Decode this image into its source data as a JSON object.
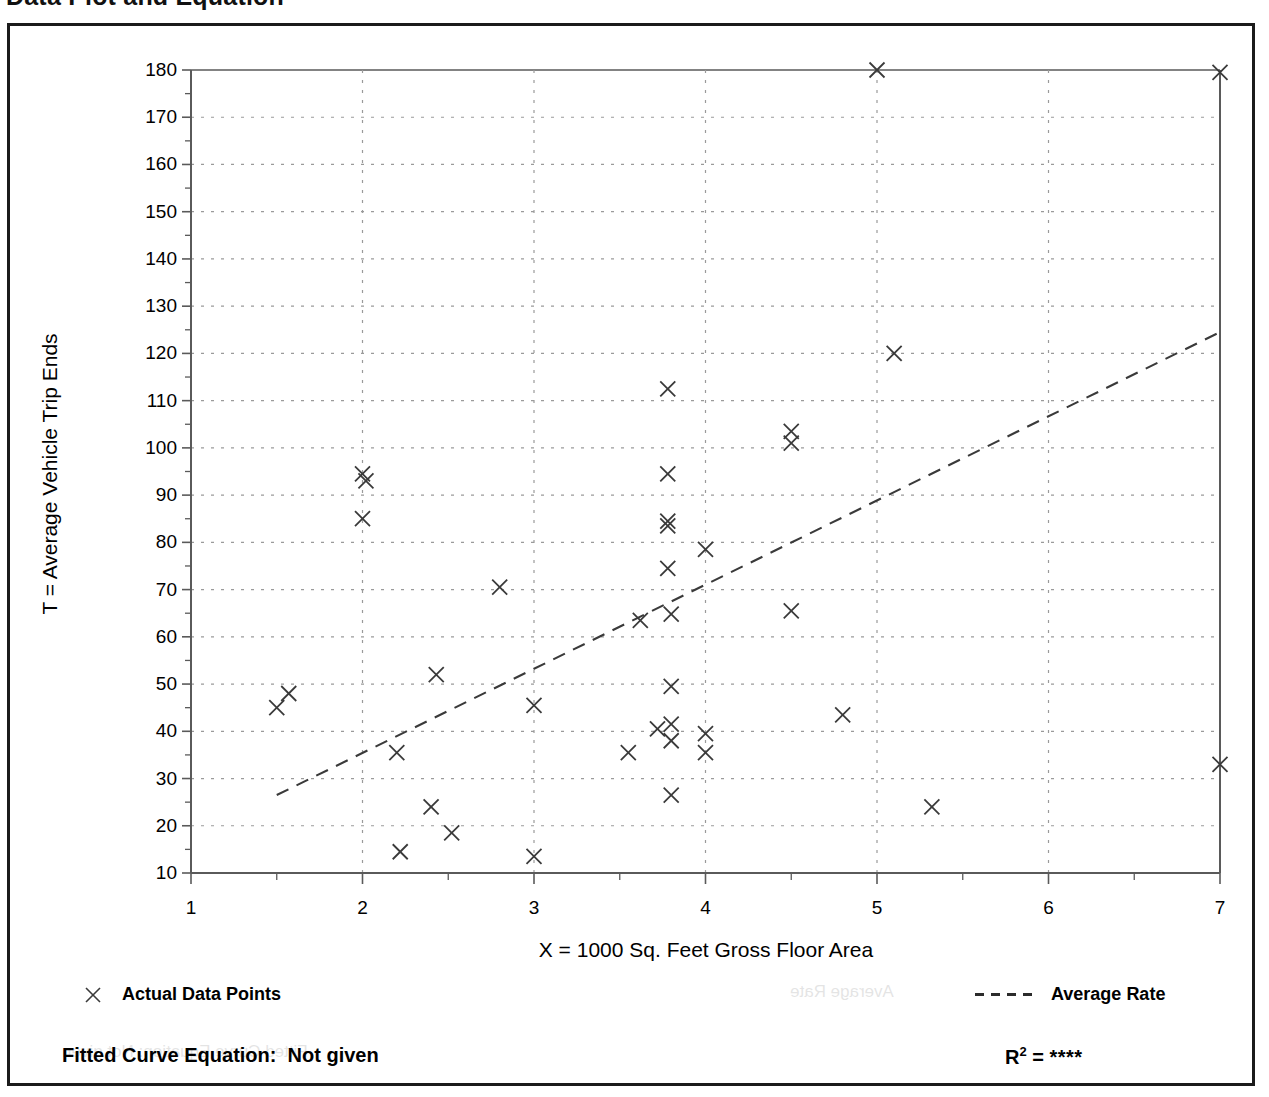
{
  "page": {
    "title": "Data Plot and Equation"
  },
  "chart_data": {
    "type": "scatter",
    "title": "Data Plot and Equation",
    "xlabel": "X = 1000 Sq. Feet Gross Floor Area",
    "ylabel": "T = Average Vehicle Trip Ends",
    "xlim": [
      1,
      7
    ],
    "ylim": [
      10,
      180
    ],
    "x_ticks": [
      "1",
      "2",
      "3",
      "4",
      "5",
      "6",
      "7"
    ],
    "x_tick_values": [
      1,
      2,
      3,
      4,
      5,
      6,
      7
    ],
    "x_minor_step": 0.5,
    "y_ticks": [
      "10",
      "20",
      "30",
      "40",
      "50",
      "60",
      "70",
      "80",
      "90",
      "100",
      "110",
      "120",
      "130",
      "140",
      "150",
      "160",
      "170",
      "180"
    ],
    "y_tick_values": [
      10,
      20,
      30,
      40,
      50,
      60,
      70,
      80,
      90,
      100,
      110,
      120,
      130,
      140,
      150,
      160,
      170,
      180
    ],
    "y_minor_step": 5,
    "grid": true,
    "grid_style": "dotted",
    "legend_position": "below-plot",
    "series": [
      {
        "name": "Actual Data Points",
        "marker": "x",
        "points": [
          [
            1.5,
            45.0
          ],
          [
            1.57,
            48.0
          ],
          [
            2.0,
            94.5
          ],
          [
            2.02,
            93.0
          ],
          [
            2.0,
            85.0
          ],
          [
            2.2,
            35.5
          ],
          [
            2.22,
            14.5
          ],
          [
            2.4,
            24.0
          ],
          [
            2.43,
            52.0
          ],
          [
            2.52,
            18.5
          ],
          [
            2.8,
            70.5
          ],
          [
            3.0,
            45.5
          ],
          [
            3.0,
            13.5
          ],
          [
            3.55,
            35.5
          ],
          [
            3.62,
            63.5
          ],
          [
            3.78,
            112.5
          ],
          [
            3.78,
            94.5
          ],
          [
            3.78,
            84.5
          ],
          [
            3.78,
            83.5
          ],
          [
            3.78,
            74.5
          ],
          [
            3.8,
            64.8
          ],
          [
            3.8,
            49.5
          ],
          [
            3.8,
            41.5
          ],
          [
            3.8,
            38.0
          ],
          [
            3.72,
            40.5
          ],
          [
            3.8,
            26.5
          ],
          [
            4.0,
            78.5
          ],
          [
            4.0,
            39.5
          ],
          [
            4.0,
            35.5
          ],
          [
            4.5,
            103.5
          ],
          [
            4.5,
            101.0
          ],
          [
            4.5,
            65.5
          ],
          [
            4.8,
            43.5
          ],
          [
            5.0,
            180.0
          ],
          [
            5.1,
            120.0
          ],
          [
            5.32,
            24.0
          ],
          [
            7.0,
            179.5
          ],
          [
            7.0,
            33.0
          ]
        ]
      },
      {
        "name": "Average Rate",
        "marker": "dashed-line",
        "line": [
          [
            1.5,
            26.5
          ],
          [
            7.0,
            124.5
          ]
        ]
      }
    ],
    "legend": [
      {
        "key": "actual-data-points",
        "label": "Actual Data Points",
        "marker": "x"
      },
      {
        "key": "average-rate",
        "label": "Average Rate",
        "marker": "dashed-line"
      }
    ],
    "fitted_curve_equation_label": "Fitted Curve Equation:",
    "fitted_curve_equation_value": "Not given",
    "r_squared_label": "R",
    "r_squared_exponent": "2",
    "r_squared_equals": " = ",
    "r_squared_value": "****"
  },
  "colors": {
    "frame": "#1b1b1b",
    "axis": "#5a5a5a",
    "grid": "#9a9a9a",
    "marker": "#3a3a3a",
    "trendline": "#3a3a3a",
    "text": "#000000",
    "background": "#ffffff"
  },
  "ghost_text": {
    "line1": "Fitted Curve Equation: Not given",
    "line2": "Average Rate"
  }
}
